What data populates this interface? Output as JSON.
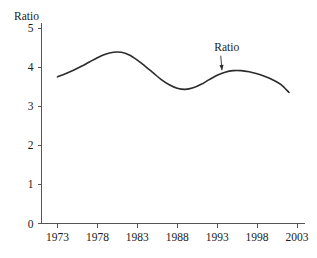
{
  "chart_data": {
    "type": "line",
    "title": "",
    "xlabel": "",
    "ylabel": "Ratio",
    "xlim": [
      1971,
      2004
    ],
    "ylim": [
      0,
      5
    ],
    "grid": false,
    "legend": "none",
    "xticks": [
      "1973",
      "1978",
      "1983",
      "1988",
      "1993",
      "1998",
      "2003"
    ],
    "xtick_values": [
      1973,
      1978,
      1983,
      1988,
      1993,
      1998,
      2003
    ],
    "yticks": [
      "0",
      "1",
      "2",
      "3",
      "4",
      "5"
    ],
    "ytick_values": [
      0,
      1,
      2,
      3,
      4,
      5
    ],
    "annotations": [
      {
        "text": "Ratio",
        "x": 1994.2,
        "y": 4.42,
        "points_to_x": 1993.6,
        "points_to_y": 3.92
      }
    ],
    "series": [
      {
        "name": "Ratio",
        "x": [
          1973,
          1974,
          1975,
          1976,
          1977,
          1978,
          1979,
          1980,
          1981,
          1982,
          1983,
          1984,
          1985,
          1986,
          1987,
          1988,
          1989,
          1990,
          1991,
          1992,
          1993,
          1994,
          1995,
          1996,
          1997,
          1998,
          1999,
          2000,
          2001,
          2002
        ],
        "values": [
          3.75,
          3.83,
          3.92,
          4.02,
          4.13,
          4.24,
          4.33,
          4.38,
          4.38,
          4.31,
          4.18,
          4.02,
          3.85,
          3.68,
          3.55,
          3.46,
          3.43,
          3.47,
          3.56,
          3.68,
          3.79,
          3.87,
          3.91,
          3.91,
          3.88,
          3.83,
          3.76,
          3.67,
          3.55,
          3.35
        ]
      }
    ]
  },
  "axis": {
    "y_axis_label": "Ratio"
  }
}
